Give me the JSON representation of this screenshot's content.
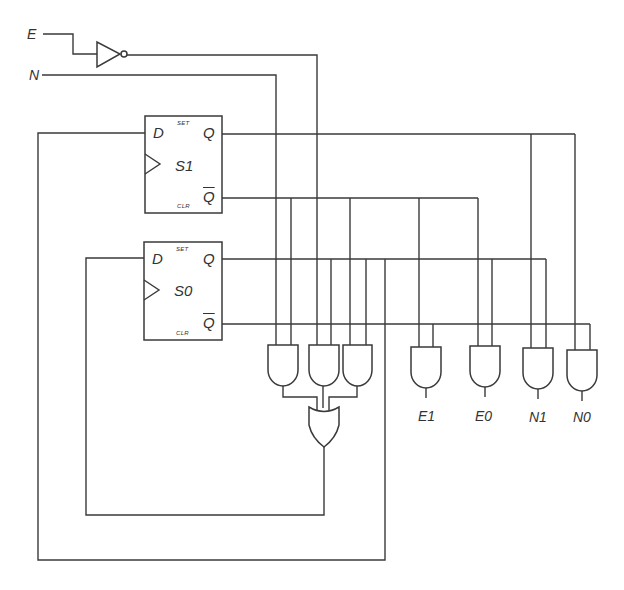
{
  "diagram": {
    "type": "sequential-logic-circuit",
    "inputs": [
      {
        "id": "E",
        "label": "E"
      },
      {
        "id": "N",
        "label": "N"
      }
    ],
    "inverter": {
      "input": "E",
      "output": "E'"
    },
    "flip_flops": [
      {
        "id": "S1",
        "label": "S1",
        "d_pin": "D",
        "q_pin": "Q",
        "qbar_pin": "Q",
        "set_label": "SET",
        "clr_label": "CLR"
      },
      {
        "id": "S0",
        "label": "S0",
        "d_pin": "D",
        "q_pin": "Q",
        "qbar_pin": "Q",
        "set_label": "SET",
        "clr_label": "CLR"
      }
    ],
    "next_state_logic": {
      "and_gates": [
        {
          "inputs": [
            "N",
            "S1'"
          ]
        },
        {
          "inputs": [
            "E'",
            "S0"
          ]
        },
        {
          "inputs": [
            "S1'",
            "S0"
          ]
        }
      ],
      "or_gate": {
        "output": "S0.D"
      },
      "feedback": {
        "S1.D": "S0.Q"
      }
    },
    "outputs": [
      {
        "label": "E1",
        "inputs": [
          "S1'",
          "S0'"
        ]
      },
      {
        "label": "E0",
        "inputs": [
          "S1'",
          "S0"
        ]
      },
      {
        "label": "N1",
        "inputs": [
          "S1",
          "S0"
        ]
      },
      {
        "label": "N0",
        "inputs": [
          "S1",
          "S0'"
        ]
      }
    ]
  },
  "colors": {
    "line": "#3a3a3a",
    "background": "#ffffff"
  }
}
